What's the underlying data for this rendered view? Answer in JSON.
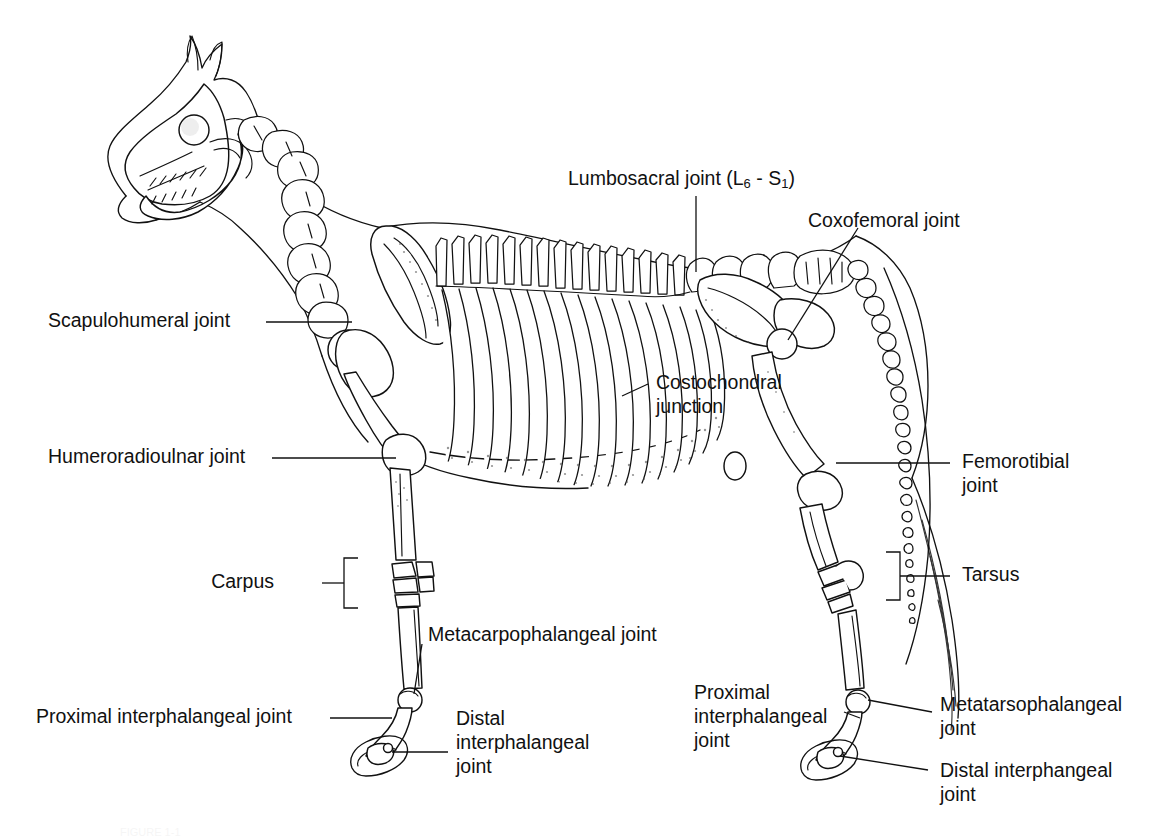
{
  "figure": {
    "line_color": "#111111",
    "background_color": "#ffffff"
  },
  "labels": {
    "lumbosacral": {
      "pre": "Lumbosacral joint (L",
      "sub1": "6",
      "mid": " - S",
      "sub2": "1",
      "post": ")"
    },
    "coxofemoral": "Coxofemoral joint",
    "scapulohumeral": "Scapulohumeral joint",
    "humeroradioulnar": "Humeroradioulnar joint",
    "costochondral_line1": "Costochondral",
    "costochondral_line2": "junction",
    "femorotibial_line1": "Femorotibial",
    "femorotibial_line2": "joint",
    "carpus": "Carpus",
    "tarsus": "Tarsus",
    "metacarpophalangeal": "Metacarpophalangeal joint",
    "fore_proximal_interphalangeal": "Proximal interphalangeal joint",
    "fore_distal_line1": "Distal",
    "fore_distal_line2": "interphalangeal",
    "fore_distal_line3": "joint",
    "hind_proximal_line1": "Proximal",
    "hind_proximal_line2": "interphalangeal",
    "hind_proximal_line3": "joint",
    "metatarsophalangeal_line1": "Metatarsophalangeal",
    "metatarsophalangeal_line2": "joint",
    "hind_distal_line1": "Distal interphangeal",
    "hind_distal_line2": "joint"
  },
  "caption": {
    "partial_text": "FIGURE 1-1"
  }
}
